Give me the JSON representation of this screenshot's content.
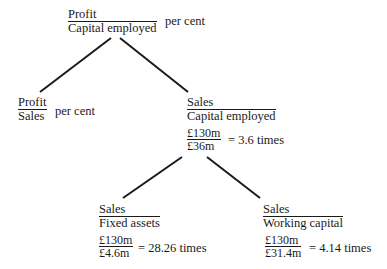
{
  "diagram": {
    "root": {
      "numerator": "Profit",
      "denominator": "Capital employed",
      "suffix": "per cent"
    },
    "left_child": {
      "numerator": "Profit",
      "denominator": "Sales",
      "suffix": "per cent"
    },
    "right_child": {
      "numerator": "Sales",
      "denominator": "Capital employed",
      "calc_numerator": "£130m",
      "calc_denominator": "£36m",
      "result": "= 3.6 times"
    },
    "fixed_assets_node": {
      "numerator": "Sales",
      "denominator": "Fixed assets",
      "calc_numerator": "£130m",
      "calc_denominator": "£4.6m",
      "result": "= 28.26 times"
    },
    "working_capital_node": {
      "numerator": "Sales",
      "denominator": "Working capital",
      "calc_numerator": "£130m",
      "calc_denominator": "£31.4m",
      "result": "= 4.14 times"
    },
    "line_color": "#1a1a1a"
  }
}
